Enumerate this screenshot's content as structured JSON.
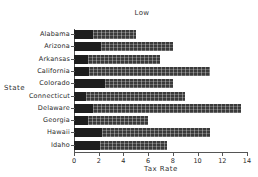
{
  "chart_data": {
    "type": "bar",
    "orientation": "horizontal",
    "title": "Low",
    "xlabel": "Tax Rate",
    "ylabel": "State",
    "categories": [
      "Alabama",
      "Arizona",
      "Arkansas",
      "California",
      "Colorado",
      "Connecticut",
      "Delaware",
      "Georgia",
      "Hawaii",
      "Idaho"
    ],
    "values": [
      5.0,
      8.0,
      7.0,
      11.0,
      8.0,
      9.0,
      13.5,
      6.0,
      11.0,
      7.5
    ],
    "segment_low": [
      1.5,
      2.2,
      1.1,
      1.2,
      2.5,
      1.0,
      1.5,
      1.1,
      2.3,
      2.1
    ],
    "xlim": [
      0,
      14
    ],
    "xticks": [
      0,
      2,
      4,
      6,
      8,
      10,
      12,
      14
    ],
    "xtick_labels": [
      "0",
      "2",
      "4",
      "6",
      "8",
      "10",
      "12",
      "14"
    ],
    "grid": false,
    "legend": "none",
    "colors": {
      "bar_dark": "#1e1e1e",
      "bar_hatched": "#3a3a3a",
      "axis": "#555555",
      "text": "#2b2b2b",
      "background": "#ffffff"
    }
  }
}
